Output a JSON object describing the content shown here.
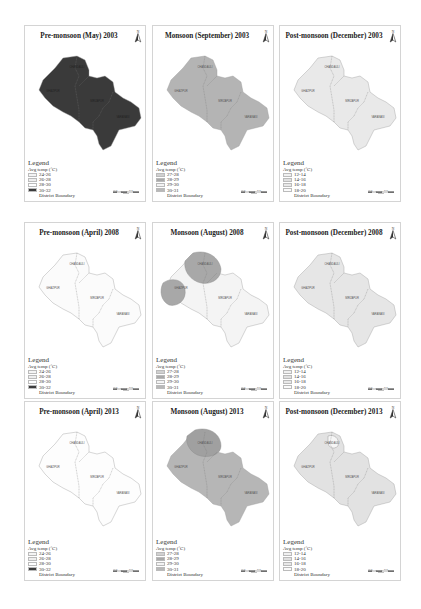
{
  "figure": {
    "legend_title": "Legend",
    "legend_subtitle": "Avg temp (˚C)",
    "boundary_label": "District Boundary",
    "north_label": "N",
    "district_labels": [
      "CHANDAULI",
      "GHAZIPUR",
      "MIRZAPUR",
      "VARANASI",
      "SONBHADRA"
    ],
    "panels": [
      {
        "title": "Pre-monsoon (May) 2003",
        "classes": [
          {
            "label": "24-26",
            "color": "#f4f4f4"
          },
          {
            "label": "26-28",
            "color": "#eeeeee"
          },
          {
            "label": "28-30",
            "color": "#ffffff"
          },
          {
            "label": "30-32",
            "color": "#3c3c3c"
          }
        ],
        "fill": "#3a3a3a",
        "highlight_fill": "#3a3a3a"
      },
      {
        "title": "Monsoon (September) 2003",
        "classes": [
          {
            "label": "27-28",
            "color": "#d0d0d0"
          },
          {
            "label": "28-29",
            "color": "#a9a9a9"
          },
          {
            "label": "29-30",
            "color": "#f3f3f3"
          },
          {
            "label": "30-31",
            "color": "#b8b8b8"
          }
        ],
        "fill": "#b4b4b4",
        "highlight_fill": "#b4b4b4"
      },
      {
        "title": "Post-monsoon (December) 2003",
        "classes": [
          {
            "label": "12-14",
            "color": "#f0f0f0"
          },
          {
            "label": "14-16",
            "color": "#e0e0e0"
          },
          {
            "label": "16-18",
            "color": "#e8e8e8"
          },
          {
            "label": "18-20",
            "color": "#fafafa"
          }
        ],
        "fill": "#e9e9e9",
        "highlight_fill": "#e9e9e9"
      },
      {
        "title": "Pre-monsoon (April) 2008",
        "classes": [
          {
            "label": "24-26",
            "color": "#f4f4f4"
          },
          {
            "label": "26-28",
            "color": "#eeeeee"
          },
          {
            "label": "28-30",
            "color": "#ffffff"
          },
          {
            "label": "30-32",
            "color": "#3c3c3c"
          }
        ],
        "fill": "#fbfbfb",
        "highlight_fill": "#f0f0f0"
      },
      {
        "title": "Monsoon (August) 2008",
        "classes": [
          {
            "label": "27-28",
            "color": "#d0d0d0"
          },
          {
            "label": "28-29",
            "color": "#a9a9a9"
          },
          {
            "label": "29-30",
            "color": "#f3f3f3"
          },
          {
            "label": "30-31",
            "color": "#b8b8b8"
          }
        ],
        "fill": "#f4f4f4",
        "highlight_fill": "#a8a8a8"
      },
      {
        "title": "Post-monsoon (December) 2008",
        "classes": [
          {
            "label": "12-14",
            "color": "#f0f0f0"
          },
          {
            "label": "14-16",
            "color": "#e0e0e0"
          },
          {
            "label": "16-18",
            "color": "#e8e8e8"
          },
          {
            "label": "18-20",
            "color": "#fafafa"
          }
        ],
        "fill": "#e6e6e6",
        "highlight_fill": "#e6e6e6"
      },
      {
        "title": "Pre-monsoon (April) 2013",
        "classes": [
          {
            "label": "24-26",
            "color": "#f4f4f4"
          },
          {
            "label": "26-28",
            "color": "#eeeeee"
          },
          {
            "label": "28-30",
            "color": "#ffffff"
          },
          {
            "label": "30-32",
            "color": "#3c3c3c"
          }
        ],
        "fill": "#fdfdfd",
        "highlight_fill": "#fdfdfd"
      },
      {
        "title": "Monsoon (August) 2013",
        "classes": [
          {
            "label": "27-28",
            "color": "#d0d0d0"
          },
          {
            "label": "28-29",
            "color": "#a9a9a9"
          },
          {
            "label": "29-30",
            "color": "#f3f3f3"
          },
          {
            "label": "30-31",
            "color": "#b8b8b8"
          }
        ],
        "fill": "#b6b6b6",
        "highlight_fill": "#a0a0a0"
      },
      {
        "title": "Post-monsoon (December) 2013",
        "classes": [
          {
            "label": "12-14",
            "color": "#f0f0f0"
          },
          {
            "label": "14-16",
            "color": "#e0e0e0"
          },
          {
            "label": "16-18",
            "color": "#e8e8e8"
          },
          {
            "label": "18-20",
            "color": "#fafafa"
          }
        ],
        "fill": "#e2e2e2",
        "highlight_fill": "#f6f6f6"
      }
    ]
  }
}
